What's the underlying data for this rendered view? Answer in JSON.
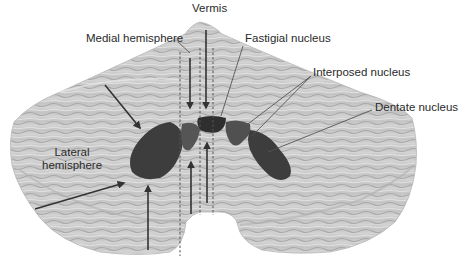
{
  "figure": {
    "colors": {
      "background": "#ffffff",
      "cortex": "#c9c9c9",
      "cortex_shade": "#a9a9a9",
      "cortex_light": "#e2e2e2",
      "nucleus": "#3a3a3a",
      "nucleus_mid": "#555555",
      "arrow": "#333333",
      "leader": "#555555",
      "dashed": "#555555"
    },
    "labels": {
      "vermis": "Vermis",
      "medial_hemisphere": "Medial hemisphere",
      "fastigial_nucleus": "Fastigial nucleus",
      "interposed_nucleus": "Interposed nucleus",
      "dentate_nucleus": "Dentate nucleus",
      "lateral_hemisphere_line1": "Lateral",
      "lateral_hemisphere_line2": "hemisphere"
    }
  }
}
